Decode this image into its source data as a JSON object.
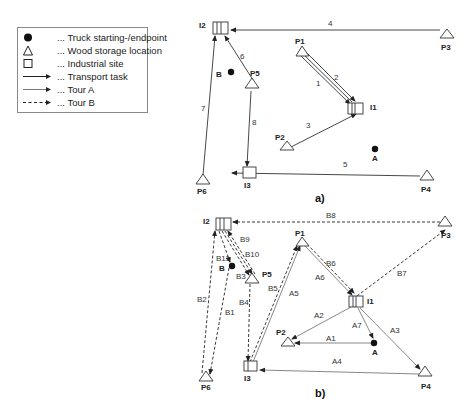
{
  "legend": {
    "items": [
      {
        "icon": "filled-circle-icon",
        "label": "... Truck starting-/endpoint"
      },
      {
        "icon": "triangle-icon",
        "label": "... Wood storage location"
      },
      {
        "icon": "square-icon",
        "label": "... Industrial site"
      },
      {
        "icon": "solid-arrow-icon",
        "label": "... Transport task"
      },
      {
        "icon": "dotted-arrow-icon",
        "label": "... Tour A"
      },
      {
        "icon": "dashed-arrow-icon",
        "label": "... Tour B"
      }
    ]
  },
  "panel_a": {
    "caption": "a)",
    "nodes": {
      "I1": "I1",
      "I2": "I2",
      "I3": "I3",
      "P1": "P1",
      "P2": "P2",
      "P3": "P3",
      "P4": "P4",
      "P5": "P5",
      "P6": "P6",
      "A": "A",
      "B": "B"
    },
    "edges": [
      {
        "label": "1",
        "from": "P1",
        "to": "I1"
      },
      {
        "label": "2",
        "from": "P1",
        "to": "I1"
      },
      {
        "label": "3",
        "from": "P2",
        "to": "I1"
      },
      {
        "label": "4",
        "from": "P3",
        "to": "I2"
      },
      {
        "label": "5",
        "from": "P4",
        "to": "I3"
      },
      {
        "label": "6",
        "from": "P5",
        "to": "I2"
      },
      {
        "label": "7",
        "from": "P6",
        "to": "I2"
      },
      {
        "label": "8",
        "from": "P5",
        "to": "I3"
      }
    ]
  },
  "panel_b": {
    "caption": "b)",
    "nodes": {
      "I1": "I1",
      "I2": "I2",
      "I3": "I3",
      "P1": "P1",
      "P2": "P2",
      "P3": "P3",
      "P4": "P4",
      "P5": "P5",
      "P6": "P6",
      "A": "A",
      "B": "B"
    },
    "tour_a": [
      {
        "label": "A1",
        "from": "A",
        "to": "P2"
      },
      {
        "label": "A2",
        "from": "I1",
        "to": "P2"
      },
      {
        "label": "A3",
        "from": "I1",
        "to": "P4"
      },
      {
        "label": "A4",
        "from": "P4",
        "to": "I3"
      },
      {
        "label": "A5",
        "from": "I3",
        "to": "P1"
      },
      {
        "label": "A6",
        "from": "P1",
        "to": "I1"
      },
      {
        "label": "A7",
        "from": "I1",
        "to": "A"
      }
    ],
    "tour_b": [
      {
        "label": "B1",
        "from": "B",
        "to": "P6"
      },
      {
        "label": "B2",
        "from": "P6",
        "to": "I2"
      },
      {
        "label": "B3",
        "from": "I2",
        "to": "P5"
      },
      {
        "label": "B4",
        "from": "P5",
        "to": "I3"
      },
      {
        "label": "B5",
        "from": "I3",
        "to": "P1"
      },
      {
        "label": "B6",
        "from": "P1",
        "to": "I1"
      },
      {
        "label": "B7",
        "from": "I1",
        "to": "P3"
      },
      {
        "label": "B8",
        "from": "P3",
        "to": "I2"
      },
      {
        "label": "B9",
        "from": "I2",
        "to": "P5"
      },
      {
        "label": "B10",
        "from": "P5",
        "to": "I2"
      },
      {
        "label": "B11",
        "from": "I2",
        "to": "B"
      }
    ]
  },
  "colors": {
    "line": "#333333",
    "legend_border": "#8a8a8a",
    "background": "#ffffff"
  }
}
